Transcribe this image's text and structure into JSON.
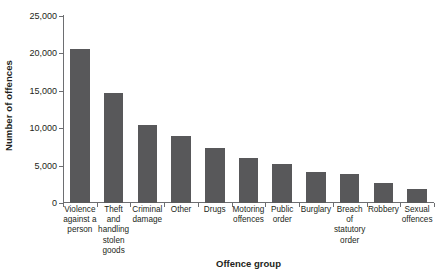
{
  "chart_data": {
    "type": "bar",
    "title": "",
    "xlabel": "Offence group",
    "ylabel": "Number of offences",
    "categories": [
      "Violence against a person",
      "Theft and handling stolen goods",
      "Criminal damage",
      "Other",
      "Drugs",
      "Motoring offences",
      "Public order",
      "Burglary",
      "Breach of statutory order",
      "Robbery",
      "Sexual offences"
    ],
    "values": [
      20600,
      14700,
      10400,
      9000,
      7300,
      6000,
      5200,
      4200,
      3900,
      2700,
      1900
    ],
    "ylim": [
      0,
      25000
    ],
    "ytick_values": [
      0,
      5000,
      10000,
      15000,
      20000,
      25000
    ],
    "ytick_labels": [
      "0",
      "5,000",
      "10,000",
      "15,000",
      "20,000",
      "25,000"
    ],
    "grid": false,
    "legend": null,
    "bar_color": "#58585a",
    "axis_color": "#6d6e71"
  },
  "axis_titles": {
    "y": "Number of offences",
    "x": "Offence group"
  }
}
